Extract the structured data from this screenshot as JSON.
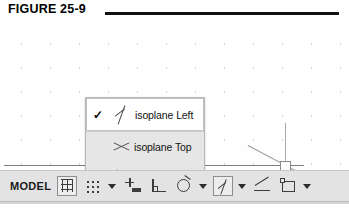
{
  "figure": {
    "label": "FIGURE 25-9",
    "rule_color": "#111111"
  },
  "menu": {
    "name": "isoplane-context-menu",
    "background": "#e6e6e6",
    "selected_background": "#ffffff",
    "check_glyph": "✓",
    "items": [
      {
        "label": "isoplane Left",
        "icon": "isoplane-left-icon",
        "checked": true,
        "selected": true
      },
      {
        "label": "isoplane Top",
        "icon": "isoplane-top-icon",
        "checked": false,
        "selected": false
      },
      {
        "label": "isoplane Right",
        "icon": "isoplane-right-icon",
        "checked": false,
        "selected": false
      }
    ]
  },
  "status_bar": {
    "model_label": "MODEL",
    "background": "#e3e3e3",
    "buttons": [
      {
        "name": "grid-display-button",
        "icon": "grid-icon",
        "active": true,
        "caret": false
      },
      {
        "name": "snap-mode-button",
        "icon": "snap-dots-icon",
        "active": false,
        "caret": true
      },
      {
        "name": "infer-constraints-button",
        "icon": "infer-constraints-icon",
        "active": false,
        "caret": false
      },
      {
        "name": "ortho-mode-button",
        "icon": "ortho-icon",
        "active": false,
        "caret": false
      },
      {
        "name": "polar-tracking-button",
        "icon": "polar-tracking-icon",
        "active": false,
        "caret": true
      },
      {
        "name": "isoplane-button",
        "icon": "isoplane-left-icon",
        "active": true,
        "caret": true
      },
      {
        "name": "object-snap-tracking-button",
        "icon": "angle-icon",
        "active": false,
        "caret": false
      },
      {
        "name": "object-snap-button",
        "icon": "object-snap-icon",
        "active": false,
        "caret": true
      }
    ]
  },
  "canvas": {
    "cursor": "isometric-crosshair",
    "pick_box": "pick-box"
  }
}
